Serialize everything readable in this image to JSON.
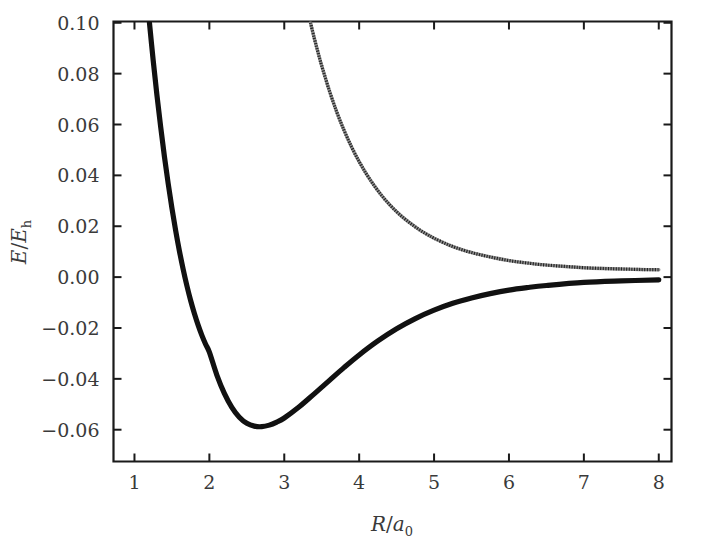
{
  "figure": {
    "background_color": "#ffffff",
    "foreground_color": "#1a1a1a"
  },
  "chart_data": {
    "type": "line",
    "title": "",
    "subtitle": "",
    "xlabel": "R/a_0",
    "xlabel_parts": {
      "symbol": "R",
      "slash": "/",
      "denominator": "a",
      "denominator_sub": "0"
    },
    "ylabel": "E/E_h",
    "ylabel_parts": {
      "numerator": "E",
      "slash": "/",
      "denominator": "E",
      "denominator_sub": "h"
    },
    "xlim": [
      0.72,
      8.17
    ],
    "ylim": [
      -0.0725,
      0.1005
    ],
    "grid": false,
    "legend": null,
    "xticks": [
      1,
      2,
      3,
      4,
      5,
      6,
      7,
      8
    ],
    "xticklabels": [
      "1",
      "2",
      "3",
      "4",
      "5",
      "6",
      "7",
      "8"
    ],
    "yticks": [
      0.1,
      0.08,
      0.06,
      0.04,
      0.02,
      0.0,
      -0.02,
      -0.04,
      -0.06
    ],
    "yticklabels": [
      "0.10",
      "0.08",
      "0.06",
      "0.04",
      "0.02",
      "0.00",
      "−0.02",
      "−0.04",
      "−0.06"
    ],
    "annotations": [],
    "series": [
      {
        "name": "bonding-state",
        "style": "solid-thick-black",
        "color": "#111111",
        "x": [
          1.2,
          1.25,
          1.3,
          1.35,
          1.4,
          1.45,
          1.5,
          1.55,
          1.6,
          1.65,
          1.7,
          1.75,
          1.8,
          1.85,
          1.9,
          1.95,
          2.0,
          2.1,
          2.2,
          2.3,
          2.4,
          2.5,
          2.6,
          2.7,
          2.8,
          2.9,
          3.0,
          3.2,
          3.4,
          3.6,
          3.8,
          4.0,
          4.25,
          4.5,
          4.75,
          5.0,
          5.25,
          5.5,
          5.75,
          6.0,
          6.25,
          6.5,
          7.0,
          7.5,
          8.0
        ],
        "y": [
          0.1,
          0.0852,
          0.0715,
          0.059,
          0.0474,
          0.0368,
          0.0271,
          0.0183,
          0.0103,
          0.0031,
          -0.0034,
          -0.0092,
          -0.0143,
          -0.0189,
          -0.0229,
          -0.0264,
          -0.0295,
          -0.0385,
          -0.0457,
          -0.0512,
          -0.0551,
          -0.0575,
          -0.0586,
          -0.0588,
          -0.0582,
          -0.057,
          -0.0554,
          -0.051,
          -0.0459,
          -0.0407,
          -0.0355,
          -0.0306,
          -0.0251,
          -0.0203,
          -0.0163,
          -0.013,
          -0.0103,
          -0.0082,
          -0.0065,
          -0.0051,
          -0.0041,
          -0.0033,
          -0.0021,
          -0.0015,
          -0.0011
        ]
      },
      {
        "name": "antibonding-state",
        "style": "dotted-thin-gray",
        "color": "#8e8e8e",
        "x": [
          3.35,
          3.4,
          3.45,
          3.5,
          3.6,
          3.7,
          3.8,
          3.9,
          4.0,
          4.1,
          4.2,
          4.3,
          4.4,
          4.5,
          4.6,
          4.7,
          4.8,
          4.9,
          5.0,
          5.2,
          5.4,
          5.6,
          5.8,
          6.0,
          6.2,
          6.4,
          6.6,
          6.8,
          7.0,
          7.25,
          7.5,
          7.75,
          8.0
        ],
        "y": [
          0.1,
          0.094,
          0.0884,
          0.0831,
          0.0735,
          0.065,
          0.0576,
          0.0511,
          0.0454,
          0.0404,
          0.036,
          0.0321,
          0.0287,
          0.0257,
          0.0231,
          0.0208,
          0.0187,
          0.0169,
          0.0153,
          0.0126,
          0.0105,
          0.0089,
          0.0076,
          0.0065,
          0.0057,
          0.005,
          0.0045,
          0.0041,
          0.0037,
          0.0034,
          0.0032,
          0.003,
          0.0029
        ]
      }
    ]
  }
}
